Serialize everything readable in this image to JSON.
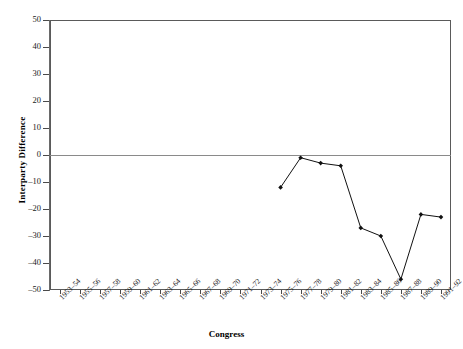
{
  "chart_data": {
    "type": "line",
    "title": "",
    "xlabel": "Congress",
    "ylabel": "Interparty Difference",
    "ylim": [
      -50,
      50
    ],
    "yticks": [
      50,
      40,
      30,
      20,
      10,
      0,
      -10,
      -20,
      -30,
      -40,
      -50
    ],
    "ytick_labels": [
      "50",
      "40",
      "30",
      "20",
      "10",
      "0",
      "-10",
      "-20",
      "-30",
      "-40",
      "-50"
    ],
    "grid": false,
    "legend": "none",
    "zero_line": 0,
    "categories": [
      "1953-54",
      "1955-56",
      "1957-58",
      "1959-60",
      "1961-62",
      "1963-64",
      "1965-66",
      "1967-68",
      "1969-70",
      "1971-72",
      "1973-74",
      "1975-76",
      "1977-78",
      "1979-80",
      "1981-82",
      "1983-84",
      "1985-86",
      "1987-88",
      "1989-90",
      "1991-92"
    ],
    "series": [
      {
        "name": "Interparty Difference",
        "marker": "filled-diamond",
        "color": "#111111",
        "values": [
          null,
          null,
          null,
          null,
          null,
          null,
          null,
          null,
          null,
          null,
          null,
          -12,
          -1,
          -3,
          -4,
          -27,
          -30,
          -46,
          -22,
          -23
        ]
      }
    ]
  }
}
